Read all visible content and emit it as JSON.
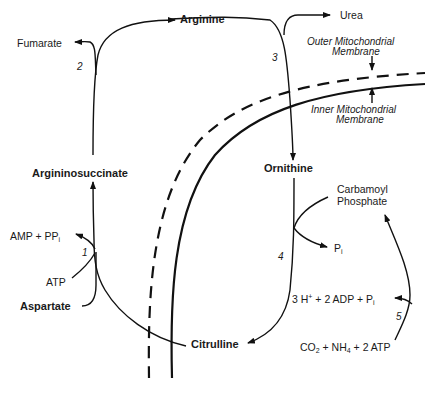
{
  "diagram": {
    "metabolites": {
      "arginine": "Arginine",
      "urea": "Urea",
      "fumarate": "Fumarate",
      "argininosuccinate": "Argininosuccinate",
      "ornithine": "Ornithine",
      "citrulline": "Citrulline",
      "aspartate": "Aspartate",
      "carbamoyl_phosphate_line1": "Carbamoyl",
      "carbamoyl_phosphate_line2": "Phosphate"
    },
    "cofactors": {
      "amp_ppi": "AMP + PP",
      "amp_ppi_sub": "i",
      "atp": "ATP",
      "pi": "P",
      "pi_sub": "i",
      "step5_products": "3 H",
      "step5_products_sup": "+",
      "step5_products_rest": " + 2 ADP + P",
      "step5_products_sub": "i",
      "step5_substrates_co": "CO",
      "step5_substrates_co_sub": "2",
      "step5_substrates_nh": " + NH",
      "step5_substrates_nh_sub": "4",
      "step5_substrates_atp": " + 2 ATP"
    },
    "steps": [
      "1",
      "2",
      "3",
      "4",
      "5"
    ],
    "membranes": {
      "outer_line1": "Outer Mitochondrial",
      "outer_line2": "Membrane",
      "inner_line1": "Inner Mitochondrial",
      "inner_line2": "Membrane"
    }
  }
}
